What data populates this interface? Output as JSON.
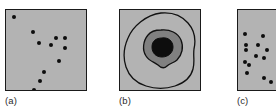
{
  "figure": {
    "type": "scientific-figure-panels",
    "background_color": "#ffffff",
    "panel_fill_color": "#b3b3b3",
    "panel_border_color": "#1a1a1a",
    "point_color": "#0d0d0d",
    "contour_color": "#111111",
    "inner_blob_color": "#808080",
    "core_color": "#0d0d0d",
    "panels": [
      {
        "id": "a",
        "caption": "(a)",
        "content_kind": "point-pattern",
        "point_count": 11,
        "points": [
          {
            "x": 6,
            "y": 5
          },
          {
            "x": 25,
            "y": 20
          },
          {
            "x": 31,
            "y": 31
          },
          {
            "x": 43,
            "y": 33
          },
          {
            "x": 48,
            "y": 26
          },
          {
            "x": 57,
            "y": 26
          },
          {
            "x": 57,
            "y": 36
          },
          {
            "x": 51,
            "y": 49
          },
          {
            "x": 36,
            "y": 60
          },
          {
            "x": 32,
            "y": 69
          },
          {
            "x": 26,
            "y": 78
          }
        ]
      },
      {
        "id": "b",
        "caption": "(b)",
        "content_kind": "nested-contours",
        "contour_count": 3,
        "levels": [
          "outer boundary",
          "mid intensity region",
          "peak core"
        ]
      },
      {
        "id": "c",
        "caption": "(c)",
        "content_kind": "point-pattern",
        "clipped_at_right_edge": true,
        "point_count": 15,
        "points": [
          {
            "x": 38,
            "y": 5
          },
          {
            "x": 5,
            "y": 22
          },
          {
            "x": 23,
            "y": 24
          },
          {
            "x": 6,
            "y": 33
          },
          {
            "x": 6,
            "y": 38
          },
          {
            "x": 18,
            "y": 33
          },
          {
            "x": 27,
            "y": 38
          },
          {
            "x": 16,
            "y": 44
          },
          {
            "x": 24,
            "y": 46
          },
          {
            "x": 5,
            "y": 50
          },
          {
            "x": 9,
            "y": 53
          },
          {
            "x": 7,
            "y": 61
          },
          {
            "x": 24,
            "y": 66
          },
          {
            "x": 31,
            "y": 70
          },
          {
            "x": 38,
            "y": 67
          }
        ]
      }
    ]
  }
}
